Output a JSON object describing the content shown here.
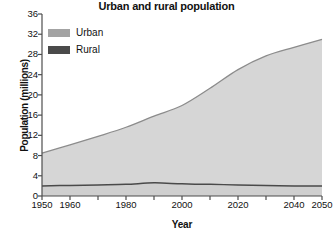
{
  "chart_data": {
    "type": "area",
    "title": "Urban and rural population",
    "xlabel": "Year",
    "ylabel": "Population (millions)",
    "xlim": [
      1950,
      2050
    ],
    "ylim": [
      0,
      36
    ],
    "ytick_step": 4,
    "yticks": [
      0,
      4,
      8,
      12,
      16,
      20,
      24,
      28,
      32,
      36
    ],
    "ytick_labels": [
      "0",
      "4",
      "8",
      "12",
      "16",
      "20",
      "24",
      "28",
      "32",
      "36"
    ],
    "xticks": [
      1950,
      1960,
      1970,
      1980,
      1990,
      2000,
      2010,
      2020,
      2030,
      2040,
      2050
    ],
    "xtick_labels": [
      {
        "value": 1950,
        "label": "1950"
      },
      {
        "value": 1960,
        "label": "1960"
      },
      {
        "value": 1970,
        "label": ""
      },
      {
        "value": 1980,
        "label": "1980"
      },
      {
        "value": 1990,
        "label": ""
      },
      {
        "value": 2000,
        "label": "2000"
      },
      {
        "value": 2010,
        "label": ""
      },
      {
        "value": 2020,
        "label": "2020"
      },
      {
        "value": 2030,
        "label": ""
      },
      {
        "value": 2040,
        "label": "2040"
      },
      {
        "value": 2050,
        "label": "2050"
      }
    ],
    "grid": false,
    "legend_position": "top-left",
    "stacked": true,
    "x": [
      1950,
      1960,
      1970,
      1980,
      1990,
      2000,
      2010,
      2020,
      2030,
      2040,
      2050
    ],
    "series": [
      {
        "name": "Rural",
        "color": "#4a4a4a",
        "fill": "#cfcfcf",
        "values": [
          2.0,
          2.1,
          2.2,
          2.3,
          2.6,
          2.4,
          2.3,
          2.2,
          2.1,
          2.0,
          2.0
        ]
      },
      {
        "name": "Urban",
        "color": "#8c8c8c",
        "fill": "#d6d6d6",
        "values": [
          6.5,
          8.0,
          9.6,
          11.3,
          13.2,
          15.5,
          19.0,
          22.8,
          25.6,
          27.4,
          29.0
        ]
      }
    ],
    "totals": [
      8.5,
      10.1,
      11.8,
      13.6,
      15.8,
      17.9,
      21.3,
      25.0,
      27.7,
      29.4,
      31.0
    ],
    "legend": [
      {
        "label": "Urban",
        "color": "#a3a3a3"
      },
      {
        "label": "Rural",
        "color": "#4a4a4a"
      }
    ],
    "axis_color": "#4d4d4d"
  }
}
